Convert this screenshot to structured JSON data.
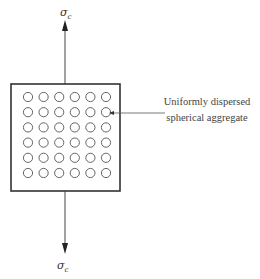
{
  "diagram": {
    "top_stress_label": "σ",
    "top_stress_subscript": "c",
    "bottom_stress_label": "σ",
    "bottom_stress_subscript": "c",
    "annotation_line1": "Uniformly dispersed",
    "annotation_line2": "spherical aggregate",
    "grid": {
      "rows": 6,
      "cols": 6
    },
    "colors": {
      "stroke": "#333333",
      "circle": "#555555",
      "text": "#444444"
    }
  }
}
